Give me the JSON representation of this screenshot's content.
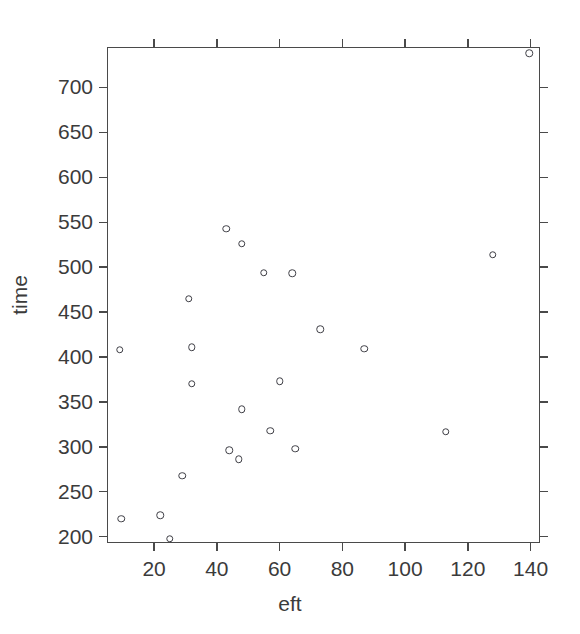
{
  "chart_data": {
    "type": "scatter",
    "title": "",
    "xlabel": "eft",
    "ylabel": "time",
    "xlim": [
      5,
      143
    ],
    "ylim": [
      193,
      745
    ],
    "grid": false,
    "legend": null,
    "xticks": [
      20,
      40,
      60,
      80,
      100,
      120,
      140
    ],
    "yticks": [
      200,
      250,
      300,
      350,
      400,
      450,
      500,
      550,
      600,
      650,
      700
    ],
    "xtick_labels": [
      "20",
      "40",
      "60",
      "80",
      "100",
      "120",
      "140"
    ],
    "ytick_labels": [
      "200",
      "250",
      "300",
      "350",
      "400",
      "450",
      "500",
      "550",
      "600",
      "650",
      "700"
    ],
    "marker": "open-circle",
    "marker_color": "#3f3f46",
    "points": [
      {
        "x": 9,
        "y": 408
      },
      {
        "x": 9.5,
        "y": 220
      },
      {
        "x": 22,
        "y": 224
      },
      {
        "x": 25,
        "y": 198
      },
      {
        "x": 29,
        "y": 268
      },
      {
        "x": 31,
        "y": 465
      },
      {
        "x": 32,
        "y": 411
      },
      {
        "x": 32,
        "y": 370
      },
      {
        "x": 43,
        "y": 543
      },
      {
        "x": 44,
        "y": 296
      },
      {
        "x": 47,
        "y": 286
      },
      {
        "x": 48,
        "y": 526
      },
      {
        "x": 48,
        "y": 342
      },
      {
        "x": 55,
        "y": 494
      },
      {
        "x": 57,
        "y": 318
      },
      {
        "x": 60,
        "y": 373
      },
      {
        "x": 64,
        "y": 493
      },
      {
        "x": 65,
        "y": 298
      },
      {
        "x": 73,
        "y": 431
      },
      {
        "x": 87,
        "y": 409
      },
      {
        "x": 113,
        "y": 317
      },
      {
        "x": 128,
        "y": 514
      },
      {
        "x": 139.5,
        "y": 738
      }
    ]
  },
  "figure": {
    "background_color": "#ffffff",
    "axis_color": "#4a4a4a",
    "text_color": "#3b3b3b"
  }
}
